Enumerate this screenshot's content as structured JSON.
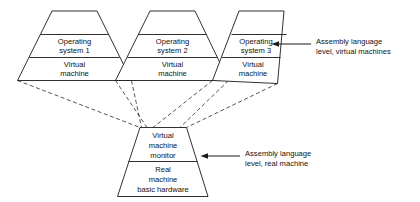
{
  "figure": {
    "background_color": "#ffffff",
    "line_color": "#1a1a1a",
    "dashed_link_color": "#2a2a2a"
  },
  "virtual_machines": [
    {
      "id": "vm-1",
      "upper_cell": {
        "line1": "Operating",
        "line2": "system 1"
      },
      "lower_cell": {
        "line1": "Virtual",
        "line2": "machine"
      }
    },
    {
      "id": "vm-2",
      "upper_cell": {
        "line1": "Operating",
        "line2": "system 2"
      },
      "lower_cell": {
        "line1": "Virtual",
        "line2": "machine"
      }
    },
    {
      "id": "vm-3",
      "upper_cell": {
        "line1": "Operating",
        "line2": "system 3"
      },
      "lower_cell": {
        "line1": "Virtual",
        "line2": "machine"
      }
    }
  ],
  "base_block": {
    "id": "vm-monitor-hardware",
    "upper_cell": {
      "line1": "Virtual",
      "line2": "machine",
      "line3": "monitor"
    },
    "lower_cell": {
      "line1": "Real",
      "line2": "machine",
      "line3": "basic hardware"
    }
  },
  "callouts": [
    {
      "id": "callout-virtual-machines",
      "line1": "Assembly language",
      "line2": "level, virtual machines"
    },
    {
      "id": "callout-real-machine",
      "line1": "Assembly language",
      "line2": "level, real machine"
    }
  ]
}
